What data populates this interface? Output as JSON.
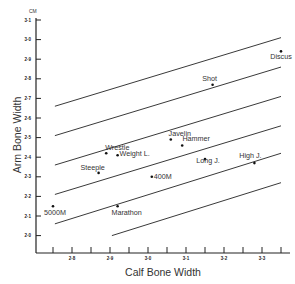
{
  "chart_data": {
    "type": "scatter",
    "title": "",
    "xlabel": "Calf Bone Width",
    "ylabel": "Arm Bone Width",
    "y_unit": "CM",
    "xlim": [
      2.75,
      3.35
    ],
    "ylim": [
      1.9,
      3.1
    ],
    "x_ticks": [
      "2·8",
      "2·9",
      "3·0",
      "3·1",
      "3·2",
      "3·3"
    ],
    "y_ticks": [
      "2·0",
      "2·1",
      "2·2",
      "2·3",
      "2·4",
      "2·5",
      "2·6",
      "2·7",
      "2·8",
      "2·9",
      "3·0",
      "3·1"
    ],
    "grid": false,
    "legend": null,
    "points": [
      {
        "label": "Discus",
        "x": 3.35,
        "y": 2.94
      },
      {
        "label": "Shot",
        "x": 3.17,
        "y": 2.77
      },
      {
        "label": "Javelin",
        "x": 3.06,
        "y": 2.49
      },
      {
        "label": "Hammer",
        "x": 3.09,
        "y": 2.46
      },
      {
        "label": "Wrestle",
        "x": 2.89,
        "y": 2.42
      },
      {
        "label": "Weight L.",
        "x": 2.92,
        "y": 2.41
      },
      {
        "label": "Steeple",
        "x": 2.87,
        "y": 2.32
      },
      {
        "label": "400M",
        "x": 3.01,
        "y": 2.3
      },
      {
        "label": "Long J.",
        "x": 3.15,
        "y": 2.39
      },
      {
        "label": "High J.",
        "x": 3.28,
        "y": 2.37
      },
      {
        "label": "5000M",
        "x": 2.75,
        "y": 2.15
      },
      {
        "label": "Marathon",
        "x": 2.92,
        "y": 2.15
      }
    ],
    "reference_lines": [
      {
        "x1": 2.755,
        "y1": 2.66,
        "x2": 3.35,
        "y2": 3.01
      },
      {
        "x1": 2.755,
        "y1": 2.51,
        "x2": 3.35,
        "y2": 2.86
      },
      {
        "x1": 2.755,
        "y1": 2.36,
        "x2": 3.35,
        "y2": 2.71
      },
      {
        "x1": 2.755,
        "y1": 2.21,
        "x2": 3.35,
        "y2": 2.56
      },
      {
        "x1": 2.755,
        "y1": 2.06,
        "x2": 3.35,
        "y2": 2.42
      },
      {
        "x1": 2.905,
        "y1": 2.0,
        "x2": 3.35,
        "y2": 2.27
      }
    ]
  }
}
